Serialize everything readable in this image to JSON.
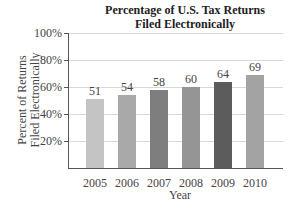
{
  "chart_data": {
    "type": "bar",
    "title": "Percentage of U.S. Tax Returns Filed Electronically",
    "title_lines": [
      "Percentage of U.S. Tax Returns",
      "Filed Electronically"
    ],
    "xlabel": "Year",
    "ylabel": "Percent of Returns Filed Electronically",
    "ylabel_lines": [
      "Percent of Returns",
      "Filed Electronically"
    ],
    "categories": [
      "2005",
      "2006",
      "2007",
      "2008",
      "2009",
      "2010"
    ],
    "values": [
      51,
      54,
      58,
      60,
      64,
      69
    ],
    "data_labels": [
      "51",
      "54",
      "58",
      "60",
      "64",
      "69"
    ],
    "bar_colors": [
      "#c4c4c4",
      "#a9a9a9",
      "#7e7e7e",
      "#959595",
      "#5c5c5c",
      "#a3a3a3"
    ],
    "ylim": [
      0,
      100
    ],
    "yticks": [
      20,
      40,
      60,
      80,
      100
    ],
    "ytick_labels": [
      "20%",
      "40%",
      "60%",
      "80%",
      "100%"
    ],
    "grid": true,
    "legend": null
  }
}
